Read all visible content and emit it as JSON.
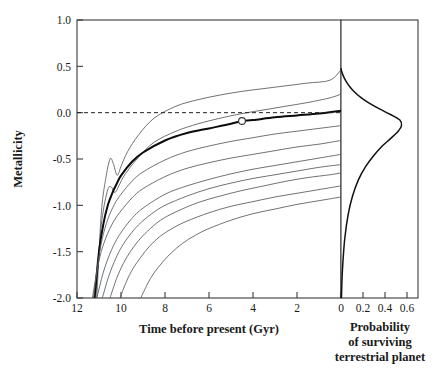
{
  "figure": {
    "background_color": "#ffffff",
    "curve_color": "#555a5e",
    "highlight_curve_color": "#0b0b0b",
    "axis_color": "#3b3b3b"
  },
  "chart_data": {
    "type": "line",
    "title": "",
    "panels": [
      {
        "id": "left-panel",
        "name": "metallicity-evolution",
        "xlabel": "Time before present (Gyr)",
        "ylabel": "Metallicity",
        "xlim": [
          12,
          0
        ],
        "ylim": [
          -2.0,
          1.0
        ],
        "x_ticks": [
          12,
          10,
          8,
          6,
          4,
          2,
          0
        ],
        "x_tick_labels": [
          "12",
          "10",
          "8",
          "6",
          "4",
          "2",
          "0"
        ],
        "y_ticks": [
          1.0,
          0.5,
          0.0,
          -0.5,
          -1.0,
          -1.5,
          -2.0
        ],
        "y_tick_labels": [
          "1.0",
          "0.5",
          "0.0",
          "-0.5",
          "-1.0",
          "-1.5",
          "-2.0"
        ],
        "x_axis_inverted": true,
        "grid": false,
        "annotations": [
          {
            "name": "zero-metallicity-reference",
            "type": "hline",
            "y": 0.0,
            "style": "dashed",
            "label": ""
          },
          {
            "name": "sun-marker",
            "type": "point",
            "x": 4.5,
            "y": -0.09,
            "marker": "open-circle",
            "label": ""
          }
        ],
        "series": [
          {
            "name": "track-1",
            "highlight": false,
            "x": [
              11.1,
              10.9,
              10.7,
              10.5,
              10.35,
              10.2,
              10.1,
              10.0,
              9.7,
              9.2,
              8.5,
              7.5,
              6.5,
              5.5,
              4.5,
              3.5,
              2.5,
              1.5,
              0.5,
              0.0
            ],
            "y": [
              -2.0,
              -1.1,
              -0.72,
              -0.5,
              -0.55,
              -0.67,
              -0.65,
              -0.58,
              -0.42,
              -0.24,
              -0.06,
              0.07,
              0.14,
              0.19,
              0.23,
              0.26,
              0.29,
              0.32,
              0.35,
              0.46
            ]
          },
          {
            "name": "track-2",
            "highlight": false,
            "x": [
              11.15,
              10.95,
              10.8,
              10.6,
              10.45,
              10.3,
              10.2,
              10.1,
              9.8,
              9.2,
              8.5,
              7.5,
              6.5,
              5.5,
              4.5,
              3.5,
              2.5,
              1.5,
              0.5,
              0.0
            ],
            "y": [
              -2.0,
              -1.35,
              -1.05,
              -0.83,
              -0.8,
              -0.86,
              -0.84,
              -0.79,
              -0.66,
              -0.48,
              -0.32,
              -0.2,
              -0.12,
              -0.06,
              -0.01,
              0.03,
              0.07,
              0.11,
              0.16,
              0.2
            ]
          },
          {
            "name": "track-3",
            "highlight": true,
            "x": [
              11.2,
              11.0,
              10.8,
              10.6,
              10.4,
              10.2,
              10.0,
              9.5,
              9.0,
              8.0,
              7.0,
              6.0,
              5.0,
              4.5,
              4.0,
              3.0,
              2.0,
              1.0,
              0.0
            ],
            "y": [
              -2.0,
              -1.5,
              -1.2,
              -1.0,
              -0.87,
              -0.77,
              -0.68,
              -0.53,
              -0.43,
              -0.3,
              -0.22,
              -0.17,
              -0.12,
              -0.09,
              -0.08,
              -0.05,
              -0.03,
              -0.01,
              0.02
            ]
          },
          {
            "name": "track-4",
            "highlight": false,
            "x": [
              11.25,
              11.05,
              10.85,
              10.6,
              10.3,
              10.0,
              9.5,
              9.0,
              8.0,
              7.0,
              6.0,
              5.0,
              4.0,
              3.0,
              2.0,
              1.0,
              0.0
            ],
            "y": [
              -2.0,
              -1.62,
              -1.36,
              -1.15,
              -0.99,
              -0.88,
              -0.74,
              -0.64,
              -0.51,
              -0.42,
              -0.36,
              -0.31,
              -0.27,
              -0.23,
              -0.2,
              -0.17,
              -0.14
            ]
          },
          {
            "name": "track-5",
            "highlight": false,
            "x": [
              11.3,
              11.1,
              10.9,
              10.6,
              10.3,
              10.0,
              9.5,
              9.0,
              8.0,
              7.0,
              6.0,
              5.0,
              4.0,
              3.0,
              2.0,
              1.0,
              0.0
            ],
            "y": [
              -2.0,
              -1.72,
              -1.5,
              -1.3,
              -1.16,
              -1.06,
              -0.92,
              -0.82,
              -0.69,
              -0.6,
              -0.54,
              -0.49,
              -0.45,
              -0.41,
              -0.37,
              -0.34,
              -0.3
            ]
          },
          {
            "name": "track-6",
            "highlight": false,
            "x": [
              11.1,
              10.8,
              10.5,
              10.2,
              9.9,
              9.5,
              9.0,
              8.0,
              7.0,
              6.0,
              5.0,
              4.0,
              3.0,
              2.0,
              1.0,
              0.0
            ],
            "y": [
              -2.0,
              -1.72,
              -1.52,
              -1.37,
              -1.26,
              -1.14,
              -1.03,
              -0.88,
              -0.79,
              -0.72,
              -0.66,
              -0.61,
              -0.57,
              -0.53,
              -0.49,
              -0.45
            ]
          },
          {
            "name": "track-7",
            "highlight": false,
            "x": [
              10.85,
              10.55,
              10.25,
              9.95,
              9.6,
              9.2,
              8.6,
              8.0,
              7.0,
              6.0,
              5.0,
              4.0,
              3.0,
              2.0,
              1.0,
              0.0
            ],
            "y": [
              -2.0,
              -1.76,
              -1.58,
              -1.44,
              -1.32,
              -1.21,
              -1.09,
              -1.0,
              -0.9,
              -0.82,
              -0.76,
              -0.71,
              -0.67,
              -0.63,
              -0.59,
              -0.56
            ]
          },
          {
            "name": "track-8",
            "highlight": false,
            "x": [
              10.5,
              10.2,
              9.9,
              9.55,
              9.2,
              8.8,
              8.2,
              7.5,
              6.5,
              5.5,
              4.5,
              3.5,
              2.5,
              1.5,
              0.5,
              0.0
            ],
            "y": [
              -2.0,
              -1.79,
              -1.63,
              -1.49,
              -1.38,
              -1.28,
              -1.16,
              -1.07,
              -0.97,
              -0.9,
              -0.84,
              -0.79,
              -0.74,
              -0.7,
              -0.67,
              -0.65
            ]
          },
          {
            "name": "track-9",
            "highlight": false,
            "x": [
              10.05,
              9.75,
              9.45,
              9.1,
              8.7,
              8.2,
              7.6,
              7.0,
              6.0,
              5.0,
              4.0,
              3.0,
              2.0,
              1.0,
              0.0
            ],
            "y": [
              -2.0,
              -1.82,
              -1.68,
              -1.56,
              -1.44,
              -1.33,
              -1.24,
              -1.17,
              -1.08,
              -1.01,
              -0.96,
              -0.91,
              -0.87,
              -0.83,
              -0.79
            ]
          },
          {
            "name": "track-10",
            "highlight": false,
            "x": [
              9.1,
              8.8,
              8.5,
              8.1,
              7.7,
              7.2,
              6.6,
              6.0,
              5.0,
              4.0,
              3.0,
              2.0,
              1.0,
              0.0
            ],
            "y": [
              -2.0,
              -1.85,
              -1.73,
              -1.61,
              -1.51,
              -1.41,
              -1.32,
              -1.25,
              -1.16,
              -1.09,
              -1.04,
              -0.99,
              -0.95,
              -0.91
            ]
          }
        ]
      },
      {
        "id": "right-panel",
        "name": "survival-probability",
        "xlabel": "Probability\nof surviving\nterrestrial planet",
        "xlabel_lines": [
          "Probability",
          "of surviving",
          "terrestrial planet"
        ],
        "ylabel": "",
        "xlim": [
          0,
          0.7
        ],
        "ylim": [
          -2.0,
          1.0
        ],
        "x_ticks": [
          0,
          0.2,
          0.4,
          0.6
        ],
        "x_tick_labels": [
          "0",
          "0.2",
          "0.4",
          "0.6"
        ],
        "grid": false,
        "series": [
          {
            "name": "survival-probability-distribution",
            "orientation": "horizontal",
            "y": [
              0.48,
              0.45,
              0.4,
              0.34,
              0.28,
              0.22,
              0.16,
              0.1,
              0.04,
              -0.02,
              -0.08,
              -0.14,
              -0.2,
              -0.28,
              -0.36,
              -0.46,
              -0.58,
              -0.72,
              -0.9,
              -1.1,
              -1.35,
              -1.6,
              -1.8,
              -2.0
            ],
            "x": [
              0.0,
              0.005,
              0.02,
              0.045,
              0.08,
              0.125,
              0.185,
              0.26,
              0.35,
              0.45,
              0.535,
              0.55,
              0.52,
              0.45,
              0.375,
              0.3,
              0.225,
              0.16,
              0.105,
              0.065,
              0.035,
              0.018,
              0.009,
              0.004
            ]
          }
        ]
      }
    ]
  },
  "labels": {
    "y_axis_title": "Metallicity",
    "x_axis_title_left": "Time before present (Gyr)",
    "x_axis_title_right_line1": "Probability",
    "x_axis_title_right_line2": "of surviving",
    "x_axis_title_right_line3": "terrestrial planet"
  },
  "ticks": {
    "left_y": [
      "1.0",
      "0.5",
      "0.0",
      "-0.5",
      "-1.0",
      "-1.5",
      "-2.0"
    ],
    "left_x": [
      "12",
      "10",
      "8",
      "6",
      "4",
      "2",
      "0"
    ],
    "right_x": [
      "0",
      "0.2",
      "0.4",
      "0.6"
    ]
  }
}
